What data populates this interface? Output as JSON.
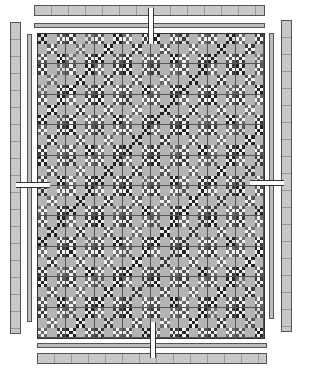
{
  "diagram": {
    "blocks_cols": 8,
    "blocks_rows": 10,
    "colors": {
      "background": "#b4b4b4",
      "dark": "#2a2a2a",
      "light": "#f2f2f2",
      "medium": "#8a8a8a",
      "border": "#c8c8c8",
      "outline": "#555555"
    },
    "borders": [
      "top-outer-pieced",
      "top-inner-strip",
      "bottom-inner-strip",
      "bottom-outer-pieced",
      "left-outer-pieced",
      "left-inner-strip",
      "right-inner-strip",
      "right-outer-pieced"
    ]
  }
}
